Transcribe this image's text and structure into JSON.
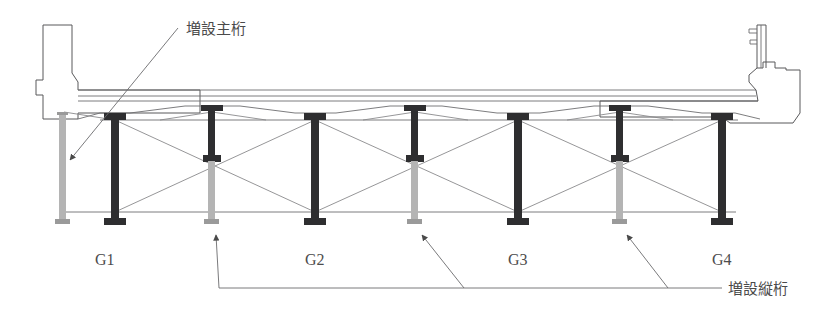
{
  "drawing": {
    "title_alt": "bridge-cross-section-girder-retrofit",
    "annotations": {
      "added_main_girder": "増設主桁",
      "added_stringer": "増設縦桁"
    },
    "girder_labels": [
      "G1",
      "G2",
      "G3",
      "G4"
    ],
    "colors": {
      "existing_girder": "#2e2e30",
      "added_girder": "#b4b4b4",
      "outline": "#58585a",
      "bracing": "#8a8a8c",
      "background": "#ffffff"
    },
    "geometry": {
      "existing_girder_x": [
        115,
        315,
        518,
        722
      ],
      "added_girder_x": [
        62,
        212,
        415,
        620
      ],
      "deck_top_y": 96,
      "deck_bottom_y": 113,
      "girder_bottom_y": 225,
      "lower_chord_y": 212
    },
    "elements": {
      "deck_slab": "deck-slab",
      "left_parapet": "left-parapet",
      "right_parapet": "right-parapet",
      "guardrail_post": "guardrail-post",
      "cross_bracing": "x-bracing",
      "lower_lateral": "lower-chord"
    }
  }
}
